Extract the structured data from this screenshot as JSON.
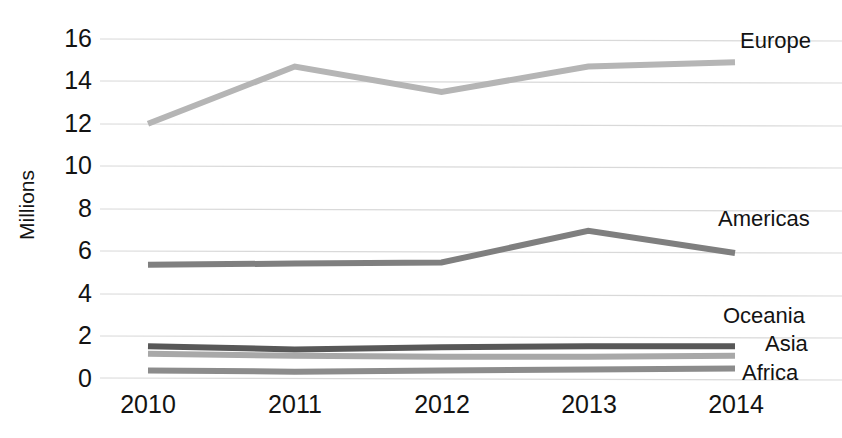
{
  "chart_data": {
    "type": "line",
    "title": "",
    "xlabel": "",
    "ylabel": "Millions",
    "categories": [
      "2010",
      "2011",
      "2012",
      "2013",
      "2014"
    ],
    "x": [
      2010,
      2011,
      2012,
      2013,
      2014
    ],
    "ylim": [
      0,
      16
    ],
    "yticks": [
      "0",
      "2",
      "4",
      "6",
      "8",
      "10",
      "12",
      "14",
      "16"
    ],
    "ytick_values": [
      0,
      2,
      4,
      6,
      8,
      10,
      12,
      14,
      16
    ],
    "grid": true,
    "legend_position": "right-inline-labels",
    "series": [
      {
        "name": "Europe",
        "color": "#b5b5b5",
        "values": [
          12.0,
          14.7,
          13.5,
          14.7,
          14.9
        ]
      },
      {
        "name": "Americas",
        "color": "#7f7f7f",
        "values": [
          5.35,
          5.4,
          5.45,
          6.95,
          5.9
        ]
      },
      {
        "name": "Asia",
        "color": "#585858",
        "values": [
          1.5,
          1.35,
          1.45,
          1.5,
          1.5
        ]
      },
      {
        "name": "Oceania",
        "color": "#a8a8a8",
        "values": [
          1.15,
          1.05,
          1.0,
          1.0,
          1.05
        ]
      },
      {
        "name": "Africa",
        "color": "#8c8c8c",
        "values": [
          0.35,
          0.3,
          0.35,
          0.4,
          0.45
        ]
      }
    ],
    "annotations": [
      {
        "label": "Europe",
        "anchor_series": "Europe"
      },
      {
        "label": "Americas",
        "anchor_series": "Americas"
      },
      {
        "label": "Oceania",
        "anchor_series": "Oceania"
      },
      {
        "label": "Asia",
        "anchor_series": "Asia"
      },
      {
        "label": "Africa",
        "anchor_series": "Africa"
      }
    ],
    "gridline_color": "#d9d9d9",
    "background": "#ffffff"
  },
  "axis": {
    "y_title": "Millions"
  },
  "ticks": {
    "y": [
      "16",
      "14",
      "12",
      "10",
      "8",
      "6",
      "4",
      "2",
      "0"
    ],
    "x": [
      "2010",
      "2011",
      "2012",
      "2013",
      "2014"
    ]
  },
  "labels": {
    "europe": "Europe",
    "americas": "Americas",
    "oceania": "Oceania",
    "asia": "Asia",
    "africa": "Africa"
  }
}
